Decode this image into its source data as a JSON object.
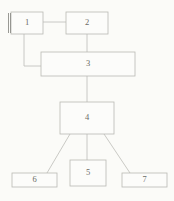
{
  "diagram": {
    "background_color": "#fbfbf8",
    "line_color": "#bdbdb7",
    "box_fill_color": "#fcfcfa",
    "box_border_color": "#b9b9b3",
    "label_color": "#6b6b66",
    "nodes": [
      {
        "id": "n1",
        "label": "1",
        "x": 11,
        "y": 12,
        "w": 32,
        "h": 22,
        "accent": "double-left-bar"
      },
      {
        "id": "n2",
        "label": "2",
        "x": 66,
        "y": 12,
        "w": 42,
        "h": 22,
        "accent": "none"
      },
      {
        "id": "n3",
        "label": "3",
        "x": 41,
        "y": 52,
        "w": 94,
        "h": 24,
        "accent": "none"
      },
      {
        "id": "n4",
        "label": "4",
        "x": 60,
        "y": 102,
        "w": 54,
        "h": 32,
        "accent": "none"
      },
      {
        "id": "n5",
        "label": "5",
        "x": 70,
        "y": 160,
        "w": 36,
        "h": 26,
        "accent": "none"
      },
      {
        "id": "n6",
        "label": "6",
        "x": 12,
        "y": 173,
        "w": 45,
        "h": 14,
        "accent": "none"
      },
      {
        "id": "n7",
        "label": "7",
        "x": 122,
        "y": 173,
        "w": 45,
        "h": 14,
        "accent": "none"
      }
    ],
    "edges": [
      {
        "id": "e1",
        "from": "n1",
        "to": "n2",
        "kind": "horizontal",
        "path": "M43 22 L66 22"
      },
      {
        "id": "e2",
        "from": "n1",
        "to": "n3",
        "kind": "elbow",
        "path": "M24 34 L24 66 L41 66"
      },
      {
        "id": "e3",
        "from": "n2",
        "to": "n3",
        "kind": "vertical",
        "path": "M87 34 L87 52"
      },
      {
        "id": "e4",
        "from": "n3",
        "to": "n4",
        "kind": "vertical",
        "path": "M87 76 L87 102"
      },
      {
        "id": "e5",
        "from": "n4",
        "to": "n6",
        "kind": "diagonal",
        "path": "M70 134 L47 173"
      },
      {
        "id": "e6",
        "from": "n4",
        "to": "n5",
        "kind": "vertical",
        "path": "M87 134 L87 160"
      },
      {
        "id": "e7",
        "from": "n4",
        "to": "n7",
        "kind": "diagonal",
        "path": "M104 134 L130 173"
      }
    ]
  }
}
